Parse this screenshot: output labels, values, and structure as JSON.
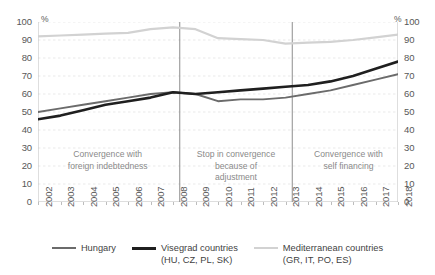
{
  "chart_data": {
    "type": "line",
    "title": "",
    "xlabel": "",
    "ylabel": "%",
    "ylabel_right": "%",
    "ylim": [
      0,
      100
    ],
    "ytick_step": 10,
    "yticks": [
      100,
      90,
      80,
      70,
      60,
      50,
      40,
      30,
      20,
      10,
      0
    ],
    "grid": true,
    "grid_style": "dashed-horizontal",
    "legend_position": "bottom",
    "x": [
      2002,
      2003,
      2004,
      2005,
      2006,
      2007,
      2008,
      2009,
      2010,
      2011,
      2012,
      2013,
      2014,
      2015,
      2016,
      2017,
      2018
    ],
    "categories": [
      "2002",
      "2003",
      "2004",
      "2005",
      "2006",
      "2007",
      "2008",
      "2009",
      "2010",
      "2011",
      "2012",
      "2013",
      "2014",
      "2015",
      "2016",
      "2017",
      "2018"
    ],
    "series": [
      {
        "name": "Hungary",
        "color": "#6b6b6b",
        "width": 1.9,
        "values": [
          50,
          52,
          54,
          56,
          58,
          60,
          61,
          60,
          56,
          57,
          57,
          58,
          60,
          62,
          65,
          68,
          71
        ]
      },
      {
        "name": "Visegrad countries (HU, CZ, PL, SK)",
        "color": "#1f1f1f",
        "width": 2.6,
        "values": [
          46,
          48,
          51,
          54,
          56,
          58,
          61,
          60,
          61,
          62,
          63,
          64,
          65,
          67,
          70,
          74,
          78
        ]
      },
      {
        "name": "Mediterranean countries (GR, IT, PO, ES)",
        "color": "#d2d2d2",
        "width": 2.2,
        "values": [
          92,
          92.5,
          93,
          93.5,
          94,
          96,
          97,
          96,
          91,
          90.5,
          90,
          88,
          88.5,
          89,
          90,
          91.5,
          93
        ]
      }
    ],
    "dividers": [
      {
        "at": 2008.3,
        "label": "divider-2008"
      },
      {
        "at": 2013.3,
        "label": "divider-2013"
      }
    ],
    "annotations": [
      {
        "text": "Convergence with\nforeign indebtedness",
        "x_center": 2005.1,
        "y_center": 20
      },
      {
        "text": "Stop in convergence\nbecause of\nadjustment",
        "x_center": 2010.8,
        "y_center": 20
      },
      {
        "text": "Convergence with\nself financing",
        "x_center": 2015.8,
        "y_center": 20
      }
    ]
  },
  "legend": {
    "items": [
      {
        "label": "Hungary",
        "color": "#6b6b6b",
        "width": 2.2
      },
      {
        "label": "Visegrad countries\n(HU, CZ, PL, SK)",
        "color": "#1f1f1f",
        "width": 3.0
      },
      {
        "label": "Mediterranean countries\n(GR, IT, PO, ES)",
        "color": "#d2d2d2",
        "width": 2.4
      }
    ]
  },
  "axis": {
    "unit_left": "%",
    "unit_right": "%"
  },
  "colors": {
    "grid": "#e9e9e9",
    "axis": "#bdbdbd",
    "divider": "#8d8d8d",
    "text": "#585858",
    "annotation_text": "#8a8a8a"
  }
}
